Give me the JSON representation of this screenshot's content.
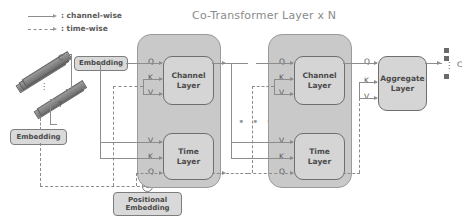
{
  "title": "Co-Transformer Layer  x N",
  "legend": [
    {
      "label": ": channel-wise",
      "style": "solid",
      "name": "channel-wise"
    },
    {
      "label": ": time-wise",
      "style": "dashed",
      "name": "time-wise"
    }
  ],
  "input": {
    "channel_axis_label": "C",
    "time_axis_label": "T",
    "vertical_dots": "⋮"
  },
  "embeddings": {
    "channel_embedding": "Embedding",
    "time_embedding": "Embedding",
    "positional_embedding": "Positional\nEmbedding",
    "positional_line1": "Positional",
    "positional_line2": "Embedding",
    "plus_symbol": "⊕"
  },
  "blocks": [
    {
      "name": "co-transformer-block-1",
      "channel_layer": {
        "line1": "Channel",
        "line2": "Layer",
        "inputs": [
          "Q",
          "K",
          "V"
        ]
      },
      "time_layer": {
        "line1": "Time",
        "line2": "Layer",
        "inputs": [
          "V",
          "K",
          "Q"
        ]
      }
    },
    {
      "name": "co-transformer-block-2",
      "channel_layer": {
        "line1": "Channel",
        "line2": "Layer",
        "inputs": [
          "Q",
          "K",
          "V"
        ]
      },
      "time_layer": {
        "line1": "Time",
        "line2": "Layer",
        "inputs": [
          "V",
          "K",
          "Q"
        ]
      }
    }
  ],
  "ellipsis": "• • •",
  "aggregate": {
    "line1": "Aggregate",
    "line2": "Layer",
    "inputs": [
      "Q",
      "K",
      "V"
    ]
  },
  "output": {
    "label": "C",
    "dots": "⋮"
  },
  "colors": {
    "block_fill": "#c9c9c9",
    "inner_fill": "#d5d5d5",
    "embedding_fill": "#d9d9d9",
    "line": "#8c8c8c",
    "text": "#4a4a4a",
    "title": "#8a8a8a"
  }
}
